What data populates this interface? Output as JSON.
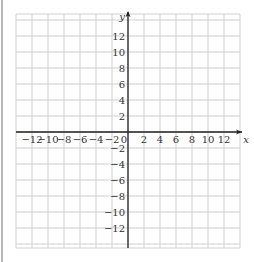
{
  "chart_data": {
    "type": "scatter",
    "title": "",
    "xlabel": "x",
    "ylabel": "y",
    "xlim": [
      -14,
      14
    ],
    "ylim": [
      -14,
      14
    ],
    "grid": true,
    "grid_step": 2,
    "x_ticks": [
      -12,
      -10,
      -8,
      -6,
      -4,
      -2,
      0,
      2,
      4,
      6,
      8,
      10,
      12
    ],
    "x_tick_labels": [
      "−12",
      "−10",
      "−8",
      "−6",
      "−4",
      "−2",
      "0",
      "2",
      "4",
      "6",
      "8",
      "10",
      "12"
    ],
    "y_ticks": [
      12,
      10,
      8,
      6,
      4,
      2,
      -2,
      -4,
      -6,
      -8,
      -10,
      -12
    ],
    "y_tick_labels": [
      "12",
      "10",
      "8",
      "6",
      "4",
      "2",
      "−2",
      "−4",
      "−6",
      "−8",
      "−10",
      "−12"
    ],
    "series": [],
    "colors": {
      "grid": "#cfcfcf",
      "axis": "#222222",
      "text": "#333333"
    }
  }
}
